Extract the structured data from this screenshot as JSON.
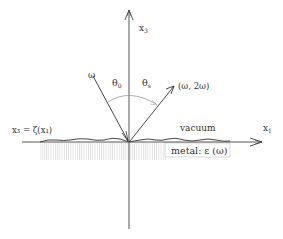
{
  "diagram": {
    "axes": {
      "x1_label": "x",
      "x1_sub": "1",
      "x3_label": "x",
      "x3_sub": "3"
    },
    "incident_label": "ω",
    "scattered_label": "(ω, 2ω)",
    "theta_0": "θ",
    "theta_0_sub": "0",
    "theta_s": "θ",
    "theta_s_sub": "s",
    "surface_label": "x₃ = ζ(x₁)",
    "vacuum_label": "vacuum",
    "metal_label": "metal: ε (ω)",
    "colors": {
      "line": "#333333",
      "hatch": "#c8c8c8",
      "arc": "#888888"
    }
  }
}
